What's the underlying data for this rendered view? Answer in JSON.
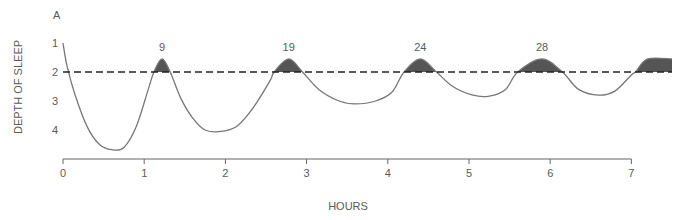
{
  "chart_data": {
    "type": "line",
    "panel_label": "A",
    "title": "",
    "xlabel": "HOURS",
    "ylabel": "DEPTH OF SLEEP",
    "x_ticks": [
      0,
      1,
      2,
      3,
      4,
      5,
      6,
      7
    ],
    "y_ticks": [
      1,
      2,
      3,
      4
    ],
    "xlim": [
      0,
      7.5
    ],
    "ylim": [
      1,
      4.75
    ],
    "y_inverted": true,
    "grid": false,
    "reference_line": {
      "y": 2,
      "style": "dashed",
      "color": "#222222"
    },
    "series": [
      {
        "name": "Sleep depth",
        "color": "#777777",
        "points": [
          [
            0.0,
            1.0
          ],
          [
            0.05,
            1.8
          ],
          [
            0.15,
            2.8
          ],
          [
            0.3,
            3.9
          ],
          [
            0.45,
            4.5
          ],
          [
            0.6,
            4.68
          ],
          [
            0.75,
            4.6
          ],
          [
            0.9,
            3.9
          ],
          [
            1.05,
            2.6
          ],
          [
            1.12,
            2.0
          ],
          [
            1.22,
            1.55
          ],
          [
            1.32,
            2.0
          ],
          [
            1.45,
            2.9
          ],
          [
            1.6,
            3.6
          ],
          [
            1.75,
            4.0
          ],
          [
            1.95,
            4.05
          ],
          [
            2.15,
            3.85
          ],
          [
            2.35,
            3.2
          ],
          [
            2.55,
            2.3
          ],
          [
            2.6,
            2.0
          ],
          [
            2.78,
            1.55
          ],
          [
            2.95,
            2.0
          ],
          [
            3.15,
            2.6
          ],
          [
            3.4,
            3.0
          ],
          [
            3.6,
            3.1
          ],
          [
            3.85,
            3.0
          ],
          [
            4.05,
            2.7
          ],
          [
            4.2,
            2.0
          ],
          [
            4.4,
            1.55
          ],
          [
            4.6,
            2.0
          ],
          [
            4.8,
            2.5
          ],
          [
            5.05,
            2.8
          ],
          [
            5.25,
            2.83
          ],
          [
            5.45,
            2.6
          ],
          [
            5.6,
            2.0
          ],
          [
            5.9,
            1.55
          ],
          [
            6.15,
            2.0
          ],
          [
            6.35,
            2.6
          ],
          [
            6.6,
            2.8
          ],
          [
            6.8,
            2.65
          ],
          [
            7.0,
            2.1
          ],
          [
            7.05,
            2.0
          ],
          [
            7.2,
            1.55
          ],
          [
            7.5,
            1.55
          ]
        ]
      }
    ],
    "rem_episodes": [
      {
        "label": "9",
        "start": 1.12,
        "end": 1.32,
        "peak": 1.22
      },
      {
        "label": "19",
        "start": 2.6,
        "end": 2.95,
        "peak": 2.78
      },
      {
        "label": "24",
        "start": 4.2,
        "end": 4.6,
        "peak": 4.4
      },
      {
        "label": "28",
        "start": 5.6,
        "end": 6.15,
        "peak": 5.9
      },
      {
        "label": "",
        "start": 7.05,
        "end": 7.5,
        "peak": 7.3
      }
    ],
    "rem_fill_color": "#555555"
  }
}
